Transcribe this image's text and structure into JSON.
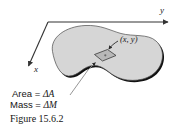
{
  "figure": {
    "number_label": "Figure 15.6.2",
    "background_color": "#ffffff",
    "lamina": {
      "name": "lamina-region",
      "fill_color": "#d6d6d6",
      "outline_color": "#111111",
      "outline_thin_color": "#555555"
    },
    "axes": {
      "y_axis_label": "y",
      "x_axis_label": "x",
      "line_color": "#333333"
    },
    "element": {
      "point_label": "(x, y)",
      "fill_color": "#b8b8b8",
      "outline_color": "#333333"
    },
    "annotations": [
      {
        "name": "area-annotation",
        "label_prefix": "Area = ",
        "delta": "Δ",
        "symbol": "A"
      },
      {
        "name": "mass-annotation",
        "label_prefix": "Mass = ",
        "delta": "Δ",
        "symbol": "M"
      }
    ],
    "leader_color": "#8a8a8a"
  }
}
